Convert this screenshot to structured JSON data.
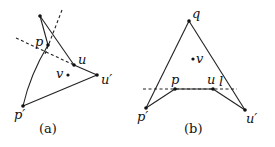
{
  "figure_a": {
    "caption": "(a)",
    "points": {
      "top": {
        "x": 40,
        "y": 16
      },
      "p": {
        "x": 48,
        "y": 45,
        "label": "p"
      },
      "u": {
        "x": 74,
        "y": 65,
        "label": "u"
      },
      "u_prime": {
        "x": 97,
        "y": 75,
        "label": "u′"
      },
      "v": {
        "x": 68,
        "y": 75,
        "label": "v"
      },
      "p_prime": {
        "x": 23,
        "y": 106,
        "label": "p′"
      }
    }
  },
  "figure_b": {
    "caption": "(b)",
    "points": {
      "q": {
        "x": 189,
        "y": 21,
        "label": "q"
      },
      "v": {
        "x": 193,
        "y": 59,
        "label": "v"
      },
      "p": {
        "x": 175,
        "y": 89,
        "label": "p"
      },
      "u": {
        "x": 213,
        "y": 89,
        "label": "u"
      },
      "p_prime": {
        "x": 146,
        "y": 108,
        "label": "p′"
      },
      "u_prime": {
        "x": 245,
        "y": 110,
        "label": "u′"
      }
    },
    "line_label": "l"
  }
}
